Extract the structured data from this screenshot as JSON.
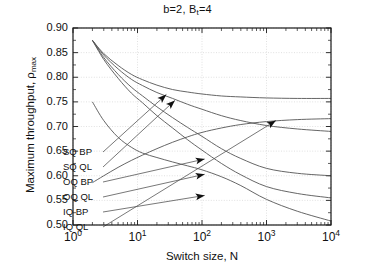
{
  "chart_data": {
    "type": "line",
    "title_parts": {
      "main1": "b=2, B",
      "sub": "t",
      "main2": "=4"
    },
    "xlabel": "Switch size, N",
    "ylabel": "Maximum throughput, ρ_max",
    "ylabel_parts": {
      "main": "Maximum throughput, ρ",
      "sub": "max"
    },
    "xscale": "log",
    "xlim": [
      1,
      10000
    ],
    "ylim": [
      0.5,
      0.9
    ],
    "grid": true,
    "legend_position": "inside-left",
    "xticks": [
      {
        "label": "10",
        "exp": "0",
        "value": 1
      },
      {
        "label": "10",
        "exp": "1",
        "value": 10
      },
      {
        "label": "10",
        "exp": "2",
        "value": 100
      },
      {
        "label": "10",
        "exp": "3",
        "value": 1000
      },
      {
        "label": "10",
        "exp": "4",
        "value": 10000
      }
    ],
    "yticks": [
      "0.90",
      "0.85",
      "0.80",
      "0.75",
      "0.70",
      "0.65",
      "0.60",
      "0.55",
      "0.50"
    ],
    "series": [
      {
        "name": "SQ BP",
        "points": [
          [
            2,
            0.875
          ],
          [
            3,
            0.848
          ],
          [
            5,
            0.824
          ],
          [
            8,
            0.806
          ],
          [
            12,
            0.795
          ],
          [
            20,
            0.784
          ],
          [
            35,
            0.775
          ],
          [
            60,
            0.77
          ],
          [
            100,
            0.766
          ],
          [
            200,
            0.762
          ],
          [
            400,
            0.76
          ],
          [
            1000,
            0.758
          ],
          [
            3000,
            0.757
          ],
          [
            10000,
            0.757
          ]
        ]
      },
      {
        "name": "SQ QL",
        "points": [
          [
            2,
            0.875
          ],
          [
            3,
            0.845
          ],
          [
            5,
            0.817
          ],
          [
            8,
            0.796
          ],
          [
            12,
            0.783
          ],
          [
            20,
            0.769
          ],
          [
            35,
            0.757
          ],
          [
            60,
            0.745
          ],
          [
            100,
            0.735
          ],
          [
            200,
            0.722
          ],
          [
            400,
            0.712
          ],
          [
            1000,
            0.702
          ],
          [
            3000,
            0.695
          ],
          [
            10000,
            0.69
          ]
        ]
      },
      {
        "name": "OQ BP",
        "points": [
          [
            2,
            0.875
          ],
          [
            3,
            0.84
          ],
          [
            5,
            0.806
          ],
          [
            8,
            0.78
          ],
          [
            12,
            0.762
          ],
          [
            20,
            0.74
          ],
          [
            35,
            0.718
          ],
          [
            60,
            0.698
          ],
          [
            100,
            0.68
          ],
          [
            200,
            0.655
          ],
          [
            400,
            0.635
          ],
          [
            1000,
            0.615
          ],
          [
            3000,
            0.605
          ],
          [
            10000,
            0.6
          ]
        ]
      },
      {
        "name": "OQ QL",
        "points": [
          [
            2,
            0.875
          ],
          [
            3,
            0.836
          ],
          [
            5,
            0.798
          ],
          [
            8,
            0.768
          ],
          [
            12,
            0.748
          ],
          [
            20,
            0.722
          ],
          [
            35,
            0.697
          ],
          [
            60,
            0.673
          ],
          [
            100,
            0.652
          ],
          [
            200,
            0.625
          ],
          [
            400,
            0.602
          ],
          [
            1000,
            0.578
          ],
          [
            3000,
            0.564
          ],
          [
            10000,
            0.555
          ]
        ]
      },
      {
        "name": "IQ BP",
        "points": [
          [
            2,
            0.75
          ],
          [
            3,
            0.712
          ],
          [
            5,
            0.678
          ],
          [
            8,
            0.658
          ],
          [
            12,
            0.646
          ],
          [
            20,
            0.637
          ],
          [
            35,
            0.628
          ],
          [
            60,
            0.62
          ],
          [
            100,
            0.612
          ],
          [
            200,
            0.598
          ],
          [
            400,
            0.58
          ],
          [
            1000,
            0.552
          ],
          [
            3000,
            0.528
          ],
          [
            10000,
            0.508
          ]
        ]
      },
      {
        "name": "IQ QL",
        "points": [
          [
            2,
            0.586
          ],
          [
            3,
            0.6
          ],
          [
            5,
            0.617
          ],
          [
            8,
            0.631
          ],
          [
            12,
            0.642
          ],
          [
            20,
            0.655
          ],
          [
            35,
            0.668
          ],
          [
            60,
            0.679
          ],
          [
            100,
            0.688
          ],
          [
            200,
            0.697
          ],
          [
            400,
            0.704
          ],
          [
            1000,
            0.71
          ],
          [
            3000,
            0.714
          ],
          [
            10000,
            0.716
          ]
        ]
      }
    ],
    "legend_entries": [
      {
        "label": "SQ BP",
        "anchor_x": 63,
        "anchor_y": 156,
        "arrow_n": 28,
        "arrow_y": 0.765,
        "arrow_dir": "up"
      },
      {
        "label": "SQ QL",
        "anchor_x": 63,
        "anchor_y": 171,
        "arrow_n": 38,
        "arrow_y": 0.753,
        "arrow_dir": "up"
      },
      {
        "label": "OQ BP",
        "anchor_x": 63,
        "anchor_y": 186,
        "arrow_n": 110,
        "arrow_y": 0.634,
        "arrow_dir": "right"
      },
      {
        "label": "OQ QL",
        "anchor_x": 63,
        "anchor_y": 201,
        "arrow_n": 110,
        "arrow_y": 0.603,
        "arrow_dir": "right"
      },
      {
        "label": "IQ BP",
        "anchor_x": 63,
        "anchor_y": 216,
        "arrow_n": 110,
        "arrow_y": 0.56,
        "arrow_dir": "right"
      },
      {
        "label": "IQ QL",
        "anchor_x": 63,
        "anchor_y": 231,
        "arrow_n": 1400,
        "arrow_y": 0.712,
        "arrow_dir": "right"
      }
    ],
    "colors": {
      "line": "#555555",
      "axis": "#1a1a1a",
      "grid": "#cccccc",
      "background": "#ffffff"
    }
  }
}
